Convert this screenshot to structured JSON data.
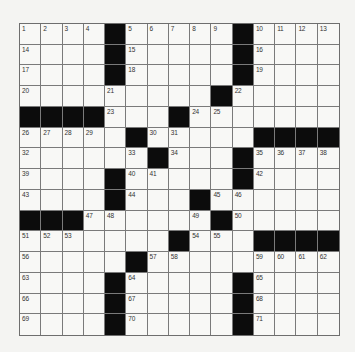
{
  "puzzle": {
    "rows": 15,
    "cols": 15,
    "colors": {
      "background": "#f4f4f2",
      "cell": "#f8f8f6",
      "block": "#0c0c0c",
      "gridline": "#7a7a7a",
      "number": "#333333"
    },
    "grid": [
      [
        "1",
        "2",
        "3",
        "4",
        "#",
        "5",
        "6",
        "7",
        "8",
        "9",
        "#",
        "10",
        "11",
        "12",
        "13"
      ],
      [
        "14",
        "",
        "",
        "",
        "#",
        "15",
        "",
        "",
        "",
        "",
        "#",
        "16",
        "",
        "",
        ""
      ],
      [
        "17",
        "",
        "",
        "",
        "#",
        "18",
        "",
        "",
        "",
        "",
        "#",
        "19",
        "",
        "",
        ""
      ],
      [
        "20",
        "",
        "",
        "",
        "21",
        "",
        "",
        "",
        "",
        "#",
        "22",
        "",
        "",
        "",
        ""
      ],
      [
        "#",
        "#",
        "#",
        "#",
        "23",
        "",
        "",
        "#",
        "24",
        "25",
        "",
        "",
        "",
        "",
        ""
      ],
      [
        "26",
        "27",
        "28",
        "29",
        "",
        "#",
        "30",
        "31",
        "",
        "",
        "",
        "#",
        "#",
        "#",
        "#"
      ],
      [
        "32",
        "",
        "",
        "",
        "",
        "33",
        "#",
        "34",
        "",
        "",
        "#",
        "35",
        "36",
        "37",
        "38"
      ],
      [
        "39",
        "",
        "",
        "",
        "#",
        "40",
        "41",
        "",
        "",
        "",
        "#",
        "42",
        "",
        "",
        ""
      ],
      [
        "43",
        "",
        "",
        "",
        "#",
        "44",
        "",
        "",
        "#",
        "45",
        "46",
        "",
        "",
        "",
        ""
      ],
      [
        "#",
        "#",
        "#",
        "47",
        "48",
        "",
        "",
        "",
        "49",
        "#",
        "50",
        "",
        "",
        "",
        ""
      ],
      [
        "51",
        "52",
        "53",
        "",
        "",
        "",
        "",
        "#",
        "54",
        "55",
        "",
        "#",
        "#",
        "#",
        "#"
      ],
      [
        "56",
        "",
        "",
        "",
        "",
        "#",
        "57",
        "58",
        "",
        "",
        "",
        "59",
        "60",
        "61",
        "62"
      ],
      [
        "63",
        "",
        "",
        "",
        "#",
        "64",
        "",
        "",
        "",
        "",
        "#",
        "65",
        "",
        "",
        ""
      ],
      [
        "66",
        "",
        "",
        "",
        "#",
        "67",
        "",
        "",
        "",
        "",
        "#",
        "68",
        "",
        "",
        ""
      ],
      [
        "69",
        "",
        "",
        "",
        "#",
        "70",
        "",
        "",
        "",
        "",
        "#",
        "71",
        "",
        "",
        ""
      ]
    ],
    "letters": []
  }
}
